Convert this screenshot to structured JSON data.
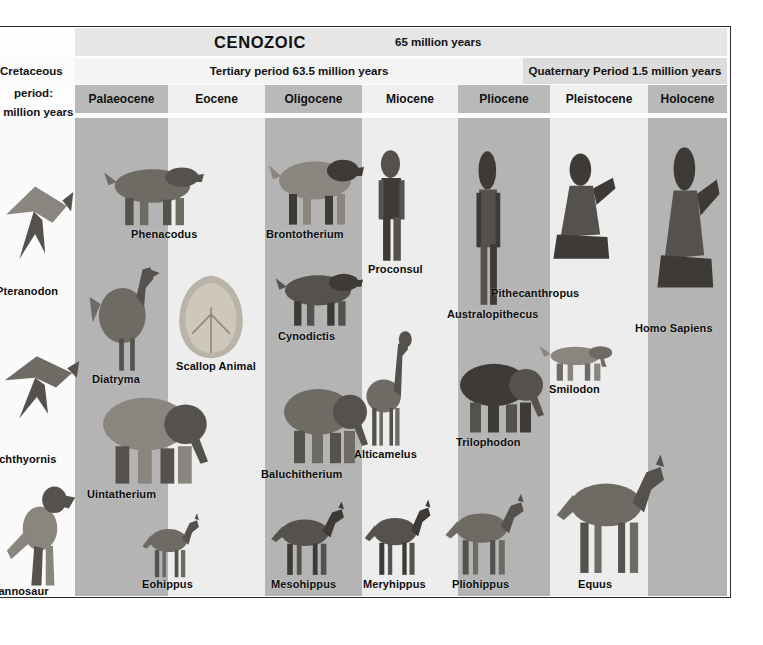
{
  "era": {
    "name": "CENOZOIC",
    "duration": "65 million years"
  },
  "periods": [
    {
      "id": "cretaceous",
      "label": "Cretaceous",
      "shade": "light"
    },
    {
      "id": "tertiary",
      "label": "Tertiary period 63.5 million years",
      "shade": "light"
    },
    {
      "id": "quaternary",
      "label": "Quaternary Period 1.5 million years",
      "shade": "dark"
    }
  ],
  "cretaceous_column": {
    "line1": "Cretaceous",
    "line2": "period:",
    "line3": "1 million years",
    "animals": [
      {
        "name": "Pteranodon",
        "x": -4,
        "y": 285
      },
      {
        "name": "Ichthyornis",
        "x": -4,
        "y": 453
      },
      {
        "name": "rannosaur",
        "x": -6,
        "y": 585
      }
    ]
  },
  "epochs": [
    {
      "label": "Palaeocene",
      "x": 0,
      "width": 93,
      "shade": "dark"
    },
    {
      "label": "Eocene",
      "x": 93,
      "width": 97,
      "shade": "light"
    },
    {
      "label": "Oligocene",
      "x": 190,
      "width": 97,
      "shade": "dark"
    },
    {
      "label": "Miocene",
      "x": 287,
      "width": 96,
      "shade": "light"
    },
    {
      "label": "Pliocene",
      "x": 383,
      "width": 92,
      "shade": "dark"
    },
    {
      "label": "Pleistocene",
      "x": 475,
      "width": 98,
      "shade": "light"
    },
    {
      "label": "Holocene",
      "x": 573,
      "width": 79,
      "shade": "dark"
    }
  ],
  "animals": [
    {
      "name": "Phenacodus",
      "epoch": "Palaeocene",
      "x": 131,
      "y": 228
    },
    {
      "name": "Diatryma",
      "epoch": "Palaeocene",
      "x": 92,
      "y": 373
    },
    {
      "name": "Uintatherium",
      "epoch": "Palaeocene",
      "x": 87,
      "y": 488
    },
    {
      "name": "Scallop Animal",
      "epoch": "Eocene",
      "x": 176,
      "y": 360
    },
    {
      "name": "Eohippus",
      "epoch": "Eocene",
      "x": 142,
      "y": 578
    },
    {
      "name": "Brontotherium",
      "epoch": "Oligocene",
      "x": 266,
      "y": 228
    },
    {
      "name": "Cynodictis",
      "epoch": "Oligocene",
      "x": 278,
      "y": 330
    },
    {
      "name": "Baluchitherium",
      "epoch": "Oligocene",
      "x": 261,
      "y": 468
    },
    {
      "name": "Mesohippus",
      "epoch": "Oligocene",
      "x": 271,
      "y": 578
    },
    {
      "name": "Proconsul",
      "epoch": "Miocene",
      "x": 368,
      "y": 263
    },
    {
      "name": "Alticamelus",
      "epoch": "Miocene",
      "x": 354,
      "y": 448
    },
    {
      "name": "Meryhippus",
      "epoch": "Miocene",
      "x": 363,
      "y": 578
    },
    {
      "name": "Australopithecus",
      "epoch": "Pliocene",
      "x": 447,
      "y": 308
    },
    {
      "name": "Trilophodon",
      "epoch": "Pliocene",
      "x": 456,
      "y": 436
    },
    {
      "name": "Pliohippus",
      "epoch": "Pliocene",
      "x": 452,
      "y": 578
    },
    {
      "name": "Pithecanthropus",
      "epoch": "Pleistocene",
      "x": 491,
      "y": 287
    },
    {
      "name": "Smilodon",
      "epoch": "Pleistocene",
      "x": 549,
      "y": 383
    },
    {
      "name": "Equus",
      "epoch": "Pleistocene",
      "x": 578,
      "y": 578
    },
    {
      "name": "Homo Sapiens",
      "epoch": "Holocene",
      "x": 635,
      "y": 322
    }
  ],
  "colors": {
    "band_dark": "#b4b4b4",
    "band_light": "#ededed",
    "header_dark": "#b9b9b9",
    "header_light": "#f0f0f0",
    "era_band": "#e6e6e6",
    "frame": "#2b2b2b",
    "text": "#111111"
  }
}
